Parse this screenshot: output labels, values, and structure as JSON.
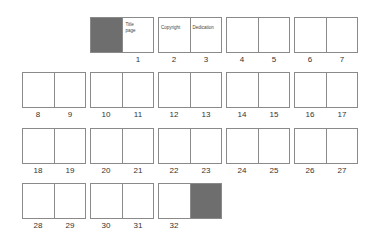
{
  "colors": {
    "page_border": "#8a8a8a",
    "shaded_page": "#6e6e6e",
    "background": "#ffffff"
  },
  "spreads": [
    {
      "row": 0,
      "col": 1,
      "left": {
        "label": "",
        "shaded": true,
        "text": ""
      },
      "right": {
        "label": "1",
        "shaded": false,
        "text": "Title page"
      }
    },
    {
      "row": 0,
      "col": 2,
      "left": {
        "label": "2",
        "shaded": false,
        "text": "Copyright"
      },
      "right": {
        "label": "3",
        "shaded": false,
        "text": "Dedication"
      }
    },
    {
      "row": 0,
      "col": 3,
      "left": {
        "label": "4",
        "shaded": false,
        "text": ""
      },
      "right": {
        "label": "5",
        "shaded": false,
        "text": ""
      }
    },
    {
      "row": 0,
      "col": 4,
      "left": {
        "label": "6",
        "shaded": false,
        "text": ""
      },
      "right": {
        "label": "7",
        "shaded": false,
        "text": ""
      }
    },
    {
      "row": 1,
      "col": 0,
      "left": {
        "label": "8",
        "shaded": false,
        "text": ""
      },
      "right": {
        "label": "9",
        "shaded": false,
        "text": ""
      }
    },
    {
      "row": 1,
      "col": 1,
      "left": {
        "label": "10",
        "shaded": false,
        "text": ""
      },
      "right": {
        "label": "11",
        "shaded": false,
        "text": ""
      }
    },
    {
      "row": 1,
      "col": 2,
      "left": {
        "label": "12",
        "shaded": false,
        "text": ""
      },
      "right": {
        "label": "13",
        "shaded": false,
        "text": ""
      }
    },
    {
      "row": 1,
      "col": 3,
      "left": {
        "label": "14",
        "shaded": false,
        "text": ""
      },
      "right": {
        "label": "15",
        "shaded": false,
        "text": ""
      }
    },
    {
      "row": 1,
      "col": 4,
      "left": {
        "label": "16",
        "shaded": false,
        "text": ""
      },
      "right": {
        "label": "17",
        "shaded": false,
        "text": ""
      }
    },
    {
      "row": 2,
      "col": 0,
      "left": {
        "label": "18",
        "shaded": false,
        "text": ""
      },
      "right": {
        "label": "19",
        "shaded": false,
        "text": ""
      }
    },
    {
      "row": 2,
      "col": 1,
      "left": {
        "label": "20",
        "shaded": false,
        "text": ""
      },
      "right": {
        "label": "21",
        "shaded": false,
        "text": ""
      }
    },
    {
      "row": 2,
      "col": 2,
      "left": {
        "label": "22",
        "shaded": false,
        "text": ""
      },
      "right": {
        "label": "23",
        "shaded": false,
        "text": ""
      }
    },
    {
      "row": 2,
      "col": 3,
      "left": {
        "label": "24",
        "shaded": false,
        "text": ""
      },
      "right": {
        "label": "25",
        "shaded": false,
        "text": ""
      }
    },
    {
      "row": 2,
      "col": 4,
      "left": {
        "label": "26",
        "shaded": false,
        "text": ""
      },
      "right": {
        "label": "27",
        "shaded": false,
        "text": ""
      }
    },
    {
      "row": 3,
      "col": 0,
      "left": {
        "label": "28",
        "shaded": false,
        "text": ""
      },
      "right": {
        "label": "29",
        "shaded": false,
        "text": ""
      }
    },
    {
      "row": 3,
      "col": 1,
      "left": {
        "label": "30",
        "shaded": false,
        "text": ""
      },
      "right": {
        "label": "31",
        "shaded": false,
        "text": ""
      }
    },
    {
      "row": 3,
      "col": 2,
      "left": {
        "label": "32",
        "shaded": false,
        "text": ""
      },
      "right": {
        "label": "",
        "shaded": true,
        "text": ""
      }
    }
  ]
}
